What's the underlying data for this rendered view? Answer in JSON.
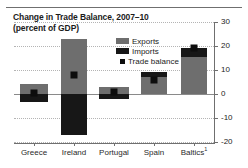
{
  "chart_data": {
    "type": "bar",
    "title": "Change in Trade Balance, 2007–10",
    "subtitle": "(percent of GDP)",
    "xlabel": "",
    "ylabel": "",
    "ylim": [
      -20,
      30
    ],
    "yticks": [
      30,
      20,
      10,
      0,
      -10,
      -20
    ],
    "ytick_labels": [
      "30",
      "20",
      "10",
      "0",
      "-10",
      "-20"
    ],
    "grid": true,
    "legend_position": "upper-right-inside",
    "categories": [
      "Greece",
      "Ireland",
      "Portugal",
      "Spain",
      "Baltics"
    ],
    "category_labels": [
      "Greece",
      "Ireland",
      "Portugal",
      "Spain",
      "Baltics¹"
    ],
    "series": [
      {
        "name": "Exports",
        "color": "#6e6e6e",
        "values": [
          4.0,
          23.0,
          3.0,
          7.0,
          15.5
        ]
      },
      {
        "name": "Imports",
        "color": "#171717",
        "values": [
          -3.5,
          -17.0,
          -2.0,
          2.0,
          3.5
        ]
      },
      {
        "name": "Trade balance",
        "color": "#0d0d0d",
        "marker": "square",
        "values": [
          0.5,
          8.0,
          1.0,
          6.0,
          19.0
        ]
      }
    ]
  },
  "legend": {
    "items": [
      {
        "label": "Exports",
        "swatch": "bar-swatch-gray"
      },
      {
        "label": "Imports",
        "swatch": "bar-swatch-dark"
      },
      {
        "label": "Trade balance",
        "swatch": "square-marker-black"
      }
    ]
  },
  "icons": {
    "exports_swatch": "legend-swatch-icon",
    "imports_swatch": "legend-swatch-icon",
    "balance_swatch": "legend-marker-icon"
  }
}
